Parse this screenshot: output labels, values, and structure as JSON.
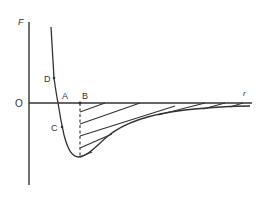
{
  "diagram": {
    "type": "force-distance curve",
    "axes": {
      "y_label": "F",
      "x_label": "r",
      "origin_label": "O"
    },
    "points": [
      {
        "id": "D",
        "label": "D",
        "description": "point on repulsive branch above axis"
      },
      {
        "id": "A",
        "label": "A",
        "description": "curve crosses r-axis (F = 0)"
      },
      {
        "id": "B",
        "label": "B",
        "description": "position of minimum force; dashed line drops to curve"
      },
      {
        "id": "C",
        "label": "C",
        "description": "point on curve below axis between A and minimum"
      }
    ],
    "shaded_region": "hatched area between r-axis and curve from B to large r"
  }
}
